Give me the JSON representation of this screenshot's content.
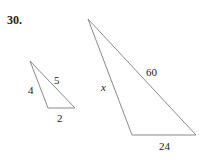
{
  "problem": {
    "number": "30."
  },
  "small_triangle": {
    "vertices": [
      [
        30,
        61
      ],
      [
        48,
        108
      ],
      [
        75,
        108
      ]
    ],
    "labels": {
      "left_side": "4",
      "hypotenuse": "5",
      "base": "2"
    }
  },
  "large_triangle": {
    "vertices": [
      [
        88,
        19
      ],
      [
        132,
        135
      ],
      [
        196,
        135
      ]
    ],
    "labels": {
      "left_side": "x",
      "hypotenuse": "60",
      "base": "24"
    }
  },
  "colors": {
    "stroke": "#8a8a8a",
    "text": "#222222"
  }
}
